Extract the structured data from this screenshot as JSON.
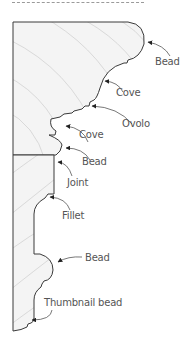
{
  "figure": {
    "labels": {
      "bead_top": "Bead",
      "cove_upper": "Cove",
      "ovolo": "Ovolo",
      "cove_lower": "Cove",
      "bead_middle": "Bead",
      "joint": "Joint",
      "fillet": "Fillet",
      "bead_lower": "Bead",
      "thumbnail_bead": "Thumbnail bead"
    },
    "colors": {
      "outline": "#3a3a3a",
      "fill": "#f4f4f4",
      "grain": "#cfcfcf",
      "text": "#555555"
    }
  }
}
